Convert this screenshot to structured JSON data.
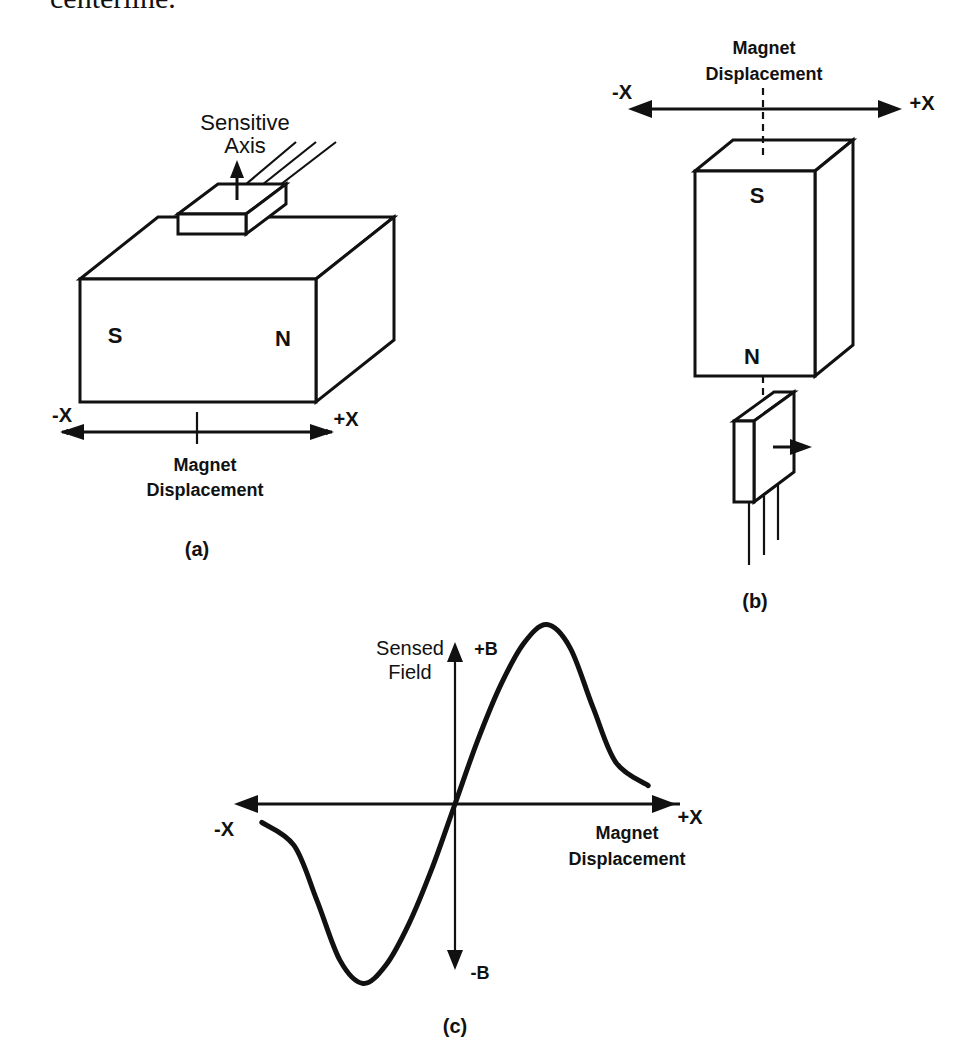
{
  "top_text": "centerline.",
  "figure_a": {
    "sensor_label_line1": "Sensitive",
    "sensor_label_line2": "Axis",
    "pole_left": "S",
    "pole_right": "N",
    "axis_minus": "-X",
    "axis_plus": "+X",
    "axis_label_line1": "Magnet",
    "axis_label_line2": "Displacement",
    "caption": "(a)"
  },
  "figure_b": {
    "axis_label_line1": "Magnet",
    "axis_label_line2": "Displacement",
    "axis_minus": "-X",
    "axis_plus": "+X",
    "pole_top": "S",
    "pole_bottom": "N",
    "caption": "(b)"
  },
  "figure_c": {
    "y_label_line1": "Sensed",
    "y_label_line2": "Field",
    "y_plus": "+B",
    "y_minus": "-B",
    "x_minus": "-X",
    "x_plus": "+X",
    "x_label_line1": "Magnet",
    "x_label_line2": "Displacement",
    "caption": "(c)"
  },
  "chart_data": {
    "type": "line",
    "title": "",
    "xlabel": "Magnet Displacement",
    "ylabel": "Sensed Field",
    "x_ticks": [
      "-X",
      "+X"
    ],
    "y_ticks": [
      "-B",
      "+B"
    ],
    "grid": false,
    "xlim": [
      -1.0,
      1.0
    ],
    "ylim": [
      -1.0,
      1.0
    ],
    "series": [
      {
        "name": "Sensed Field",
        "x": [
          -0.84,
          -0.7,
          -0.6,
          -0.5,
          -0.4,
          -0.3,
          -0.2,
          -0.1,
          0.0,
          0.1,
          0.2,
          0.3,
          0.4,
          0.5,
          0.6,
          0.7,
          0.84
        ],
        "y": [
          -0.08,
          -0.18,
          -0.42,
          -0.68,
          -0.78,
          -0.7,
          -0.52,
          -0.28,
          0.0,
          0.28,
          0.52,
          0.7,
          0.78,
          0.68,
          0.42,
          0.18,
          0.08
        ]
      }
    ]
  }
}
